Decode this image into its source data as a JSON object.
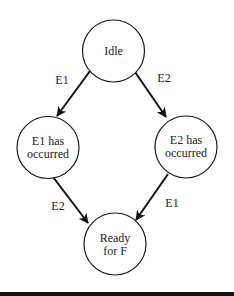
{
  "diagram": {
    "type": "state-machine",
    "states": [
      {
        "id": "idle",
        "lines": [
          "Idle"
        ]
      },
      {
        "id": "e1",
        "lines": [
          "E1 has",
          "occurred"
        ]
      },
      {
        "id": "e2",
        "lines": [
          "E2 has",
          "occurred"
        ]
      },
      {
        "id": "ready",
        "lines": [
          "Ready",
          "for F"
        ]
      }
    ],
    "transitions": [
      {
        "from": "idle",
        "to": "e1",
        "label": "E1"
      },
      {
        "from": "idle",
        "to": "e2",
        "label": "E2"
      },
      {
        "from": "e1",
        "to": "ready",
        "label": "E2"
      },
      {
        "from": "e2",
        "to": "ready",
        "label": "E1"
      }
    ]
  }
}
